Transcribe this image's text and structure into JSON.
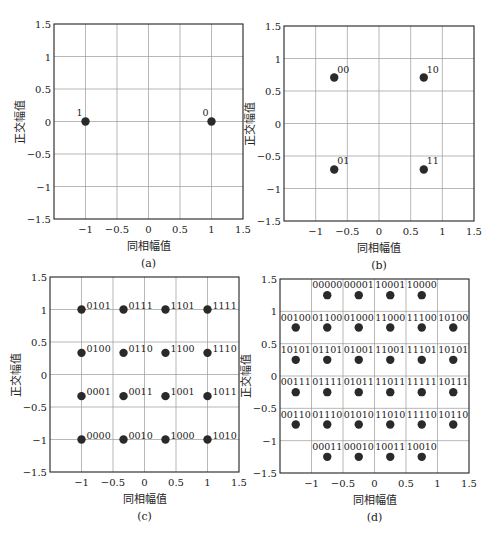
{
  "chart_data": [
    {
      "type": "scatter",
      "panel": "a",
      "title": "",
      "caption": "(a)",
      "xlabel": "同相幅值",
      "ylabel": "正交幅值",
      "xlim": [
        -1.5,
        1.5
      ],
      "ylim": [
        -1.5,
        1.5
      ],
      "xticks": [
        -1,
        -0.5,
        0,
        0.5,
        1,
        1.5
      ],
      "yticks": [
        -1.5,
        -1,
        -0.5,
        0,
        0.5,
        1,
        1.5
      ],
      "grid": true,
      "points": [
        {
          "x": -1,
          "y": 0,
          "label": "1"
        },
        {
          "x": 1,
          "y": 0,
          "label": "0"
        }
      ]
    },
    {
      "type": "scatter",
      "panel": "b",
      "title": "",
      "caption": "(b)",
      "xlabel": "同相幅值",
      "ylabel": "正交幅值",
      "xlim": [
        -1.5,
        1.5
      ],
      "ylim": [
        -1.5,
        1.5
      ],
      "xticks": [
        -1,
        -0.5,
        0,
        0.5,
        1,
        1.5
      ],
      "yticks": [
        -1.5,
        -1,
        -0.5,
        0,
        0.5,
        1,
        1.5
      ],
      "grid": true,
      "points": [
        {
          "x": -0.707,
          "y": 0.707,
          "label": "00"
        },
        {
          "x": 0.707,
          "y": 0.707,
          "label": "10"
        },
        {
          "x": -0.707,
          "y": -0.707,
          "label": "01"
        },
        {
          "x": 0.707,
          "y": -0.707,
          "label": "11"
        }
      ]
    },
    {
      "type": "scatter",
      "panel": "c",
      "title": "",
      "caption": "(c)",
      "xlabel": "同相幅值",
      "ylabel": "正交幅值",
      "xlim": [
        -1.5,
        1.5
      ],
      "ylim": [
        -1.5,
        1.5
      ],
      "xticks": [
        -1,
        -0.5,
        0,
        0.5,
        1,
        1.5
      ],
      "yticks": [
        -1.5,
        -1,
        -0.5,
        0,
        0.5,
        1,
        1.5
      ],
      "grid": true,
      "points": [
        {
          "x": -1,
          "y": 1,
          "label": "0101"
        },
        {
          "x": -0.333,
          "y": 1,
          "label": "0111"
        },
        {
          "x": 0.333,
          "y": 1,
          "label": "1101"
        },
        {
          "x": 1,
          "y": 1,
          "label": "1111"
        },
        {
          "x": -1,
          "y": 0.333,
          "label": "0100"
        },
        {
          "x": -0.333,
          "y": 0.333,
          "label": "0110"
        },
        {
          "x": 0.333,
          "y": 0.333,
          "label": "1100"
        },
        {
          "x": 1,
          "y": 0.333,
          "label": "1110"
        },
        {
          "x": -1,
          "y": -0.333,
          "label": "0001"
        },
        {
          "x": -0.333,
          "y": -0.333,
          "label": "0011"
        },
        {
          "x": 0.333,
          "y": -0.333,
          "label": "1001"
        },
        {
          "x": 1,
          "y": -0.333,
          "label": "1011"
        },
        {
          "x": -1,
          "y": -1,
          "label": "0000"
        },
        {
          "x": -0.333,
          "y": -1,
          "label": "0010"
        },
        {
          "x": 0.333,
          "y": -1,
          "label": "1000"
        },
        {
          "x": 1,
          "y": -1,
          "label": "1010"
        }
      ]
    },
    {
      "type": "scatter",
      "panel": "d",
      "title": "",
      "caption": "(d)",
      "xlabel": "同相幅值",
      "ylabel": "正交幅值",
      "xlim": [
        -1.5,
        1.5
      ],
      "ylim": [
        -1.5,
        1.5
      ],
      "xticks": [
        -1,
        -0.5,
        0,
        0.5,
        1,
        1.5
      ],
      "yticks": [
        -1.5,
        -1,
        -0.5,
        0,
        0.5,
        1,
        1.5
      ],
      "grid": true,
      "points": [
        {
          "x": -0.75,
          "y": 1.25,
          "label": "00000"
        },
        {
          "x": -0.25,
          "y": 1.25,
          "label": "00001"
        },
        {
          "x": 0.25,
          "y": 1.25,
          "label": "10001"
        },
        {
          "x": 0.75,
          "y": 1.25,
          "label": "10000"
        },
        {
          "x": -1.25,
          "y": 0.75,
          "label": "00100"
        },
        {
          "x": -0.75,
          "y": 0.75,
          "label": "01100"
        },
        {
          "x": -0.25,
          "y": 0.75,
          "label": "01000"
        },
        {
          "x": 0.25,
          "y": 0.75,
          "label": "11000"
        },
        {
          "x": 0.75,
          "y": 0.75,
          "label": "11100"
        },
        {
          "x": 1.25,
          "y": 0.75,
          "label": "10100"
        },
        {
          "x": -1.25,
          "y": 0.25,
          "label": "10101"
        },
        {
          "x": -0.75,
          "y": 0.25,
          "label": "01101"
        },
        {
          "x": -0.25,
          "y": 0.25,
          "label": "01001"
        },
        {
          "x": 0.25,
          "y": 0.25,
          "label": "11001"
        },
        {
          "x": 0.75,
          "y": 0.25,
          "label": "11101"
        },
        {
          "x": 1.25,
          "y": 0.25,
          "label": "10101"
        },
        {
          "x": -1.25,
          "y": -0.25,
          "label": "00111"
        },
        {
          "x": -0.75,
          "y": -0.25,
          "label": "01111"
        },
        {
          "x": -0.25,
          "y": -0.25,
          "label": "01011"
        },
        {
          "x": 0.25,
          "y": -0.25,
          "label": "11011"
        },
        {
          "x": 0.75,
          "y": -0.25,
          "label": "11111"
        },
        {
          "x": 1.25,
          "y": -0.25,
          "label": "10111"
        },
        {
          "x": -1.25,
          "y": -0.75,
          "label": "00110"
        },
        {
          "x": -0.75,
          "y": -0.75,
          "label": "01110"
        },
        {
          "x": -0.25,
          "y": -0.75,
          "label": "01010"
        },
        {
          "x": 0.25,
          "y": -0.75,
          "label": "11010"
        },
        {
          "x": 0.75,
          "y": -0.75,
          "label": "11110"
        },
        {
          "x": 1.25,
          "y": -0.75,
          "label": "10110"
        },
        {
          "x": -0.75,
          "y": -1.25,
          "label": "00011"
        },
        {
          "x": -0.25,
          "y": -1.25,
          "label": "00010"
        },
        {
          "x": 0.25,
          "y": -1.25,
          "label": "10011"
        },
        {
          "x": 0.75,
          "y": -1.25,
          "label": "10010"
        }
      ]
    }
  ]
}
